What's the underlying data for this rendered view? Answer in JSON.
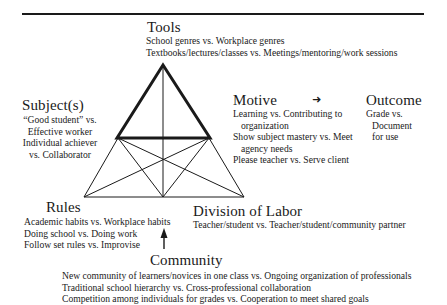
{
  "diagram": {
    "type": "activity-system-triangle",
    "nodes": {
      "tools": {
        "title": "Tools",
        "lines": [
          "School genres vs. Workplace genres",
          "Textbooks/lectures/classes vs. Meetings/mentoring/work sessions"
        ]
      },
      "subject": {
        "title": "Subject(s)",
        "lines": [
          "“Good student” vs.",
          "Effective worker",
          "Individual achiever",
          "vs. Collaborator"
        ]
      },
      "motive": {
        "title": "Motive",
        "lines": [
          "Learning vs. Contributing to",
          "organization",
          "Show subject mastery vs. Meet",
          "agency needs",
          "Please teacher vs. Serve client"
        ]
      },
      "outcome": {
        "title": "Outcome",
        "lines": [
          "Grade vs.",
          "Document",
          "for use"
        ]
      },
      "rules": {
        "title": "Rules",
        "lines": [
          "Academic habits vs. Workplace habits",
          "Doing school vs. Doing work",
          "Follow set rules vs. Improvise"
        ]
      },
      "division": {
        "title": "Division of Labor",
        "lines": [
          "Teacher/student vs. Teacher/student/community partner"
        ]
      },
      "community": {
        "title": "Community",
        "lines": [
          "New community of learners/novices in one class vs. Ongoing organization of professionals",
          "Traditional school hierarchy vs. Cross-professional collaboration",
          "Competition among individuals for grades vs. Cooperation to meet shared goals"
        ]
      }
    },
    "arrows": {
      "motive_to_outcome": "➜",
      "community_to_rules": "up-arrow"
    },
    "colors": {
      "ink": "#1a1a1a",
      "background": "#ffffff"
    }
  }
}
